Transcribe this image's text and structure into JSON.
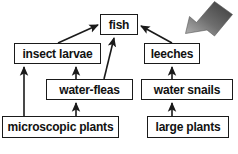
{
  "diagram": {
    "type": "food-web",
    "background_color": "#ffffff",
    "box_border_color": "#1a1a1a",
    "arrow_color": "#1a1a1a",
    "pointer_arrow": {
      "name": "gray-pointer-arrow",
      "direction": "down-left",
      "gradient_from": "#8f8f8f",
      "gradient_to": "#3a3a3a"
    },
    "nodes": [
      {
        "id": "fish",
        "label": "fish",
        "level": "top"
      },
      {
        "id": "insect-larvae",
        "label": "insect larvae",
        "level": "middle-left"
      },
      {
        "id": "leeches",
        "label": "leeches",
        "level": "middle-right"
      },
      {
        "id": "water-fleas",
        "label": "water-fleas",
        "level": "lower-left"
      },
      {
        "id": "water-snails",
        "label": "water snails",
        "level": "lower-right"
      },
      {
        "id": "microscopic-plants",
        "label": "microscopic plants",
        "level": "base-left"
      },
      {
        "id": "large-plants",
        "label": "large plants",
        "level": "base-right"
      }
    ],
    "links": [
      {
        "from": "insect-larvae",
        "to": "fish"
      },
      {
        "from": "water-fleas",
        "to": "fish"
      },
      {
        "from": "leeches",
        "to": "fish"
      },
      {
        "from": "microscopic-plants",
        "to": "insect-larvae"
      },
      {
        "from": "water-fleas",
        "to": "insect-larvae"
      },
      {
        "from": "microscopic-plants",
        "to": "water-fleas"
      },
      {
        "from": "large-plants",
        "to": "water-snails"
      },
      {
        "from": "water-snails",
        "to": "leeches"
      }
    ]
  }
}
